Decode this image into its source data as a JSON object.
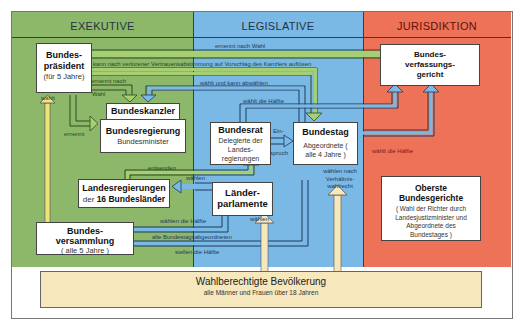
{
  "columns": {
    "exekutive": {
      "title": "EXEKUTIVE",
      "color": "#8db86a"
    },
    "legislative": {
      "title": "LEGISLATIVE",
      "color": "#7ab8e6"
    },
    "jurisdiktion": {
      "title": "JURISDIKTION",
      "color": "#ee7258"
    }
  },
  "boxes": {
    "bundespraesident": {
      "title": "Bundes-\npräsident",
      "sub": "(für 5 Jahre)"
    },
    "bundeskanzler": {
      "title": "Bundeskanzler"
    },
    "bundesregierung": {
      "title": "Bundesregierung",
      "sub": "Bundesminister"
    },
    "landesregierungen": {
      "title_a": "Landesregierungen",
      "title_b_pre": "der ",
      "title_b_bold": "16 Bundesländer"
    },
    "bundesversammlung": {
      "title": "Bundes-\nversammlung",
      "sub": "( alle 5 Jahre )"
    },
    "bundesrat": {
      "title": "Bundesrat",
      "sub": "Delegierte der Landes-regierungen"
    },
    "bundestag": {
      "title": "Bundestag",
      "sub": "Abgeordnete ( alle 4 Jahre )"
    },
    "laenderparlamente": {
      "title": "Länder-\nparlamente"
    },
    "bundesverfassungsgericht": {
      "title": "Bundes-\nverfassungs-\ngericht"
    },
    "oberste_bundesgerichte": {
      "title": "Oberste\nBundesgerichte",
      "sub": "( Wahl der Richter durch Landesjustizminister und Abgeordnete des Bundestages )"
    }
  },
  "labels": {
    "ernennt_nach_wahl_top": "ernennt nach Wahl",
    "aufloesen": "kann nach verlorener Vertrauensabstimmung auf Vorschlag des Kanzlers auflösen",
    "ernennt_nach": "ernennt nach",
    "wahl": "Wahl",
    "waehlt_und_kann_abwaehlen": "wählt und kann abwählen",
    "waehlt_die_haelfte_bundesrat": "wählt die Hälfte",
    "waehlt": "wählt",
    "ernennt": "ernennt",
    "einspruch_a": "Ein-",
    "einspruch_b": "spruch",
    "waehlt_die_haelfte_bundestag": "wählt die Hälfte",
    "entsenden": "entsenden",
    "waehlen_lr": "wählen",
    "waehlen_nach_verhaeltniswahlrecht": "wählen nach Verhältnis-wahlrecht",
    "waehlen_die_haelfte": "wählen die Hälfte",
    "waehlen_pop": "wählen",
    "alle_bundestagsabgeordneten": "alle Bundestagsabgeordneten",
    "stellen_die_haelfte": "stellen die Hälfte"
  },
  "population": {
    "title": "Wahlberechtigte Bevölkerung",
    "sub": "alle Männer und Frauen über 18 Jahren"
  }
}
